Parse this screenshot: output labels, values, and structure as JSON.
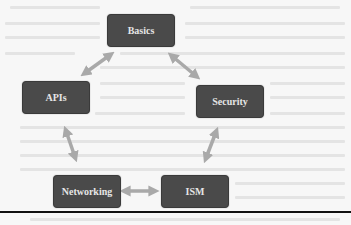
{
  "diagram": {
    "type": "cycle",
    "nodes": [
      {
        "id": "basics",
        "label": "Basics"
      },
      {
        "id": "apis",
        "label": "APIs"
      },
      {
        "id": "security",
        "label": "Security"
      },
      {
        "id": "networking",
        "label": "Networking"
      },
      {
        "id": "ism",
        "label": "ISM"
      }
    ],
    "edges": [
      {
        "from": "basics",
        "to": "apis",
        "style": "double-headed"
      },
      {
        "from": "basics",
        "to": "security",
        "style": "double-headed"
      },
      {
        "from": "apis",
        "to": "networking",
        "style": "double-headed"
      },
      {
        "from": "security",
        "to": "ism",
        "style": "double-headed"
      },
      {
        "from": "networking",
        "to": "ism",
        "style": "double-headed"
      }
    ],
    "colors": {
      "node_fill": "#4a4a4a",
      "node_text": "#e6e6e6",
      "arrow": "#a9a9a9",
      "background": "#f7f7f7",
      "rule": "#111111"
    }
  }
}
